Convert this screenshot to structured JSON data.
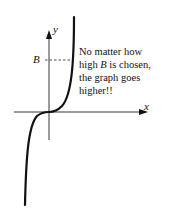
{
  "diagram": {
    "axis_labels": {
      "x": "x",
      "y": "y"
    },
    "bound_label": "B",
    "note": {
      "line1": "No matter how",
      "line2_pre": "high ",
      "line2_var": "B",
      "line2_post": " is chosen,",
      "line3": "the graph goes",
      "line4": "higher!!"
    },
    "curve": "cubic-like increasing curve through origin, unbounded above",
    "colors": {
      "ink": "#111111",
      "background": "#ffffff"
    }
  }
}
